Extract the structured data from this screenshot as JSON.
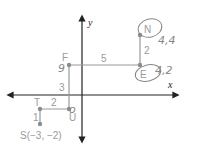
{
  "axes": {
    "x_label": "x",
    "y_label": "y"
  },
  "points": {
    "N": {
      "label": "N",
      "annotation": "4,4"
    },
    "E": {
      "label": "E",
      "annotation": "4,2"
    },
    "F": {
      "label": "F",
      "annotation": "-1,2"
    },
    "U": {
      "label": "U",
      "annotation": "-1,-1"
    },
    "T": {
      "label": "T"
    },
    "S": {
      "label": "S(−3, −2)"
    }
  },
  "segment_lengths": {
    "S_T": "1",
    "T_U": "2",
    "U_F": "3",
    "F_E": "5",
    "E_N": "2"
  },
  "colors": {
    "path": "#9a9a9a",
    "axis": "#222222",
    "point": "#8c8c8c",
    "handwriting": "#8a8a8a"
  }
}
